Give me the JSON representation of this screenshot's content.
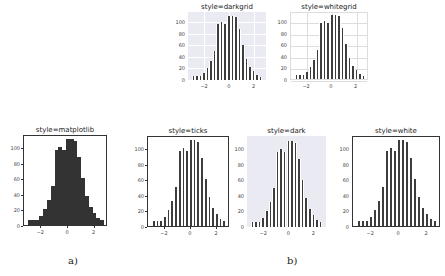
{
  "captions": {
    "a": "a)",
    "b": "b)"
  },
  "chart_data": [
    {
      "type": "bar",
      "title": "style=darkgrid",
      "style": "darkgrid",
      "x_bin_edges_range": [
        -3.0,
        2.7
      ],
      "bins": [
        7,
        7,
        7,
        12,
        21,
        32,
        50,
        97,
        100,
        96,
        110,
        111,
        108,
        87,
        61,
        37,
        23,
        16,
        9,
        6
      ],
      "xticks": [
        "−2",
        "0",
        "2"
      ],
      "yticks": [
        "0",
        "20",
        "40",
        "60",
        "80",
        "100"
      ],
      "ylim": [
        0,
        117
      ],
      "grid": true,
      "background": "#eaeaf2"
    },
    {
      "type": "bar",
      "title": "style=whitegrid",
      "style": "whitegrid",
      "x_bin_edges_range": [
        -3.0,
        2.7
      ],
      "bins": [
        7,
        7,
        7,
        12,
        21,
        32,
        50,
        97,
        100,
        96,
        110,
        111,
        108,
        87,
        61,
        37,
        23,
        16,
        9,
        6
      ],
      "xticks": [
        "−2",
        "0",
        "2"
      ],
      "yticks": [
        "0",
        "20",
        "40",
        "60",
        "80",
        "100"
      ],
      "ylim": [
        0,
        117
      ],
      "grid": true,
      "background": "#ffffff"
    },
    {
      "type": "bar",
      "title": "style=matplotlib",
      "style": "matplotlib",
      "x_bin_edges_range": [
        -3.0,
        2.7
      ],
      "bins": [
        7,
        7,
        7,
        12,
        21,
        32,
        50,
        97,
        100,
        96,
        110,
        111,
        108,
        87,
        61,
        37,
        23,
        16,
        9,
        6
      ],
      "xticks": [
        "−2",
        "0",
        "2"
      ],
      "yticks": [
        "0",
        "20",
        "40",
        "60",
        "80",
        "100"
      ],
      "ylim": [
        0,
        117
      ],
      "grid": false,
      "background": "#ffffff"
    },
    {
      "type": "bar",
      "title": "style=ticks",
      "style": "ticks",
      "x_bin_edges_range": [
        -3.0,
        2.7
      ],
      "bins": [
        7,
        7,
        7,
        12,
        21,
        32,
        50,
        97,
        100,
        96,
        110,
        111,
        108,
        87,
        61,
        37,
        23,
        16,
        9,
        6
      ],
      "xticks": [
        "−2",
        "0",
        "2"
      ],
      "yticks": [
        "0",
        "20",
        "40",
        "60",
        "80",
        "100"
      ],
      "ylim": [
        0,
        117
      ],
      "grid": false,
      "background": "#ffffff"
    },
    {
      "type": "bar",
      "title": "style=dark",
      "style": "dark",
      "x_bin_edges_range": [
        -3.0,
        2.7
      ],
      "bins": [
        7,
        7,
        7,
        12,
        21,
        32,
        50,
        97,
        100,
        96,
        110,
        111,
        108,
        87,
        61,
        37,
        23,
        16,
        9,
        6
      ],
      "xticks": [
        "−2",
        "0",
        "2"
      ],
      "yticks": [
        "0",
        "20",
        "40",
        "60",
        "80",
        "100"
      ],
      "ylim": [
        0,
        117
      ],
      "grid": false,
      "background": "#eaeaf2"
    },
    {
      "type": "bar",
      "title": "style=white",
      "style": "white",
      "x_bin_edges_range": [
        -3.0,
        2.7
      ],
      "bins": [
        7,
        7,
        7,
        12,
        21,
        32,
        50,
        97,
        100,
        96,
        110,
        111,
        108,
        87,
        61,
        37,
        23,
        16,
        9,
        6
      ],
      "xticks": [
        "−2",
        "0",
        "2"
      ],
      "yticks": [
        "0",
        "20",
        "40",
        "60",
        "80",
        "100"
      ],
      "ylim": [
        0,
        117
      ],
      "grid": false,
      "background": "#ffffff"
    }
  ]
}
